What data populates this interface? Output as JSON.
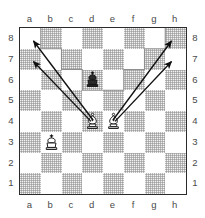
{
  "diagram": {
    "type": "chess-position-diagram",
    "title": "",
    "board": {
      "files": [
        "a",
        "b",
        "c",
        "d",
        "e",
        "f",
        "g",
        "h"
      ],
      "ranks": [
        "8",
        "7",
        "6",
        "5",
        "4",
        "3",
        "2",
        "1"
      ],
      "orientation": "white",
      "light_square_color": "#ffffff",
      "dark_square_color": "#e2e2e2",
      "border_color": "#2b2b2b",
      "coordinate_color": "#4a4a4a",
      "coordinates": {
        "top": [
          "a",
          "b",
          "c",
          "d",
          "e",
          "f",
          "g",
          "h"
        ],
        "bottom": [
          "a",
          "b",
          "c",
          "d",
          "e",
          "f",
          "g",
          "h"
        ],
        "left": [
          "8",
          "7",
          "6",
          "5",
          "4",
          "3",
          "2",
          "1"
        ],
        "right": [
          "8",
          "7",
          "6",
          "5",
          "4",
          "3",
          "2",
          "1"
        ]
      }
    },
    "pieces": [
      {
        "id": "black-king-d6",
        "piece": "king",
        "color": "black",
        "glyph": "♚",
        "square": "d6",
        "file": 3,
        "rank": 2
      },
      {
        "id": "white-bishop-d4",
        "piece": "bishop",
        "color": "white",
        "glyph": "♗",
        "square": "d4",
        "file": 3,
        "rank": 4
      },
      {
        "id": "white-bishop-e4",
        "piece": "bishop",
        "color": "white",
        "glyph": "♗",
        "square": "e4",
        "file": 4,
        "rank": 4
      },
      {
        "id": "white-king-b3",
        "piece": "king",
        "color": "white",
        "glyph": "♔",
        "square": "b3",
        "file": 1,
        "rank": 5
      }
    ],
    "arrows": [
      {
        "id": "arrow-d4-a7",
        "from": "d4",
        "to": "a7",
        "color": "#111111"
      },
      {
        "id": "arrow-d4-a8",
        "from": "d4",
        "to": "a8",
        "color": "#111111"
      },
      {
        "id": "arrow-e4-h7",
        "from": "e4",
        "to": "h7",
        "color": "#111111"
      },
      {
        "id": "arrow-e4-h8",
        "from": "e4",
        "to": "h8",
        "color": "#111111"
      }
    ],
    "outline": {
      "id": "controlled-region-outline",
      "description": "stepped trough region outline",
      "color": "#8a8a8a"
    }
  }
}
